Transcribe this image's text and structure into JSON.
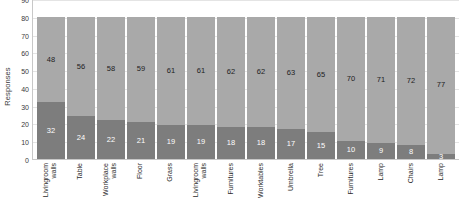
{
  "chart_data": {
    "type": "bar",
    "subtype": "stacked-bar",
    "title": "",
    "xlabel": "",
    "ylabel": "Responses",
    "ylim": [
      0,
      90
    ],
    "ytick_step": 10,
    "yticks": [
      90,
      80,
      70,
      60,
      50,
      40,
      30,
      20,
      10,
      0
    ],
    "grid": true,
    "legend": "none",
    "stack_total": 80,
    "categories": [
      "Livingroom walls",
      "Table",
      "Workplace walls",
      "Floor",
      "Grass",
      "Livingroom walls",
      "Furnitures",
      "Worktables",
      "Umbrella",
      "Tree",
      "Furnitures",
      "Lamp",
      "Chairs",
      "Lamp"
    ],
    "series": [
      {
        "name": "upper",
        "color": "#a9a9a9",
        "values": [
          48,
          56,
          58,
          59,
          61,
          61,
          62,
          62,
          63,
          65,
          70,
          71,
          72,
          77
        ]
      },
      {
        "name": "lower",
        "color": "#7d7d7d",
        "values": [
          32,
          24,
          22,
          21,
          19,
          19,
          18,
          18,
          17,
          15,
          10,
          9,
          8,
          3
        ]
      }
    ]
  },
  "colors": {
    "upper_segment": "#a9a9a9",
    "lower_segment": "#7d7d7d",
    "gridline": "#e4e4e4",
    "axis": "#c8c8c8",
    "background": "#ffffff"
  }
}
